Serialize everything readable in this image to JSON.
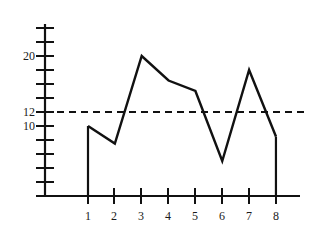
{
  "chart_data": {
    "type": "line",
    "title": "",
    "xlabel": "",
    "ylabel": "",
    "x": [
      1,
      2,
      3,
      4,
      5,
      6,
      7,
      8
    ],
    "values": [
      10,
      7.5,
      20,
      16.5,
      15,
      5,
      18,
      8.5
    ],
    "categories": [
      "1",
      "2",
      "3",
      "4",
      "5",
      "6",
      "7",
      "8"
    ],
    "xtick_labels": [
      "1",
      "2",
      "3",
      "4",
      "5",
      "6",
      "7",
      "8"
    ],
    "ytick_labels": [
      "20",
      "12",
      "10"
    ],
    "ytick_values": [
      20,
      12,
      10
    ],
    "ylim": [
      0,
      26
    ],
    "xlim": [
      0.2,
      9.2
    ],
    "grid": false,
    "legend": null,
    "annotations": [
      {
        "type": "threshold-line",
        "style": "dashed",
        "value": 12,
        "label": "12",
        "orientation": "horizontal"
      }
    ],
    "series": [
      {
        "name": "series-1",
        "values": [
          10,
          7.5,
          20,
          16.5,
          15,
          5,
          18,
          8.5
        ],
        "color": "#111111",
        "style": "solid",
        "drop_lines": true
      }
    ],
    "axis_color": "#111111",
    "line_color": "#111111",
    "threshold_color": "#111111",
    "minor_tick_step": 2
  }
}
